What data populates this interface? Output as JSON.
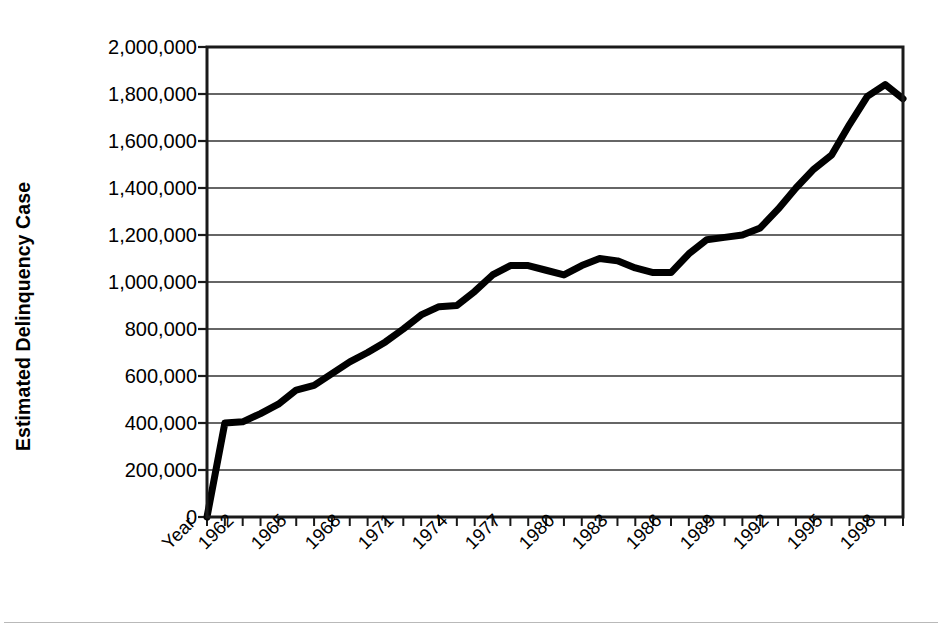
{
  "chart_data": {
    "type": "line",
    "title": "",
    "xlabel": "",
    "ylabel": "Estimated Delinquency Case",
    "x_axis_first_label": "Year",
    "xlim": [
      1960,
      1999
    ],
    "ylim": [
      0,
      2000000
    ],
    "ytick_labels": [
      "2,000,000",
      "1,800,000",
      "1,600,000",
      "1,400,000",
      "1,200,000",
      "1,000,000",
      "800,000",
      "600,000",
      "400,000",
      "200,000",
      "0"
    ],
    "ytick_values": [
      2000000,
      1800000,
      1600000,
      1400000,
      1200000,
      1000000,
      800000,
      600000,
      400000,
      200000,
      0
    ],
    "xtick_labels": [
      "Year",
      "1962",
      "1965",
      "1968",
      "1971",
      "1974",
      "1977",
      "1980",
      "1983",
      "1986",
      "1989",
      "1992",
      "1995",
      "1998"
    ],
    "xtick_values": [
      1960,
      1962,
      1965,
      1968,
      1971,
      1974,
      1977,
      1980,
      1983,
      1986,
      1989,
      1992,
      1995,
      1998
    ],
    "minor_tick_interval": 1,
    "grid": "horizontal",
    "legend": "none",
    "line_color": "#000000",
    "line_width": 7,
    "x": [
      1960,
      1961,
      1962,
      1963,
      1964,
      1965,
      1966,
      1967,
      1968,
      1969,
      1970,
      1971,
      1972,
      1973,
      1974,
      1975,
      1976,
      1977,
      1978,
      1979,
      1980,
      1981,
      1982,
      1983,
      1984,
      1985,
      1986,
      1987,
      1988,
      1989,
      1990,
      1991,
      1992,
      1993,
      1994,
      1995,
      1996,
      1997,
      1998,
      1999
    ],
    "values": [
      0,
      400000,
      405000,
      440000,
      480000,
      540000,
      560000,
      610000,
      660000,
      700000,
      745000,
      800000,
      860000,
      895000,
      900000,
      960000,
      1030000,
      1070000,
      1070000,
      1050000,
      1030000,
      1070000,
      1100000,
      1090000,
      1060000,
      1040000,
      1040000,
      1120000,
      1180000,
      1190000,
      1200000,
      1230000,
      1310000,
      1400000,
      1480000,
      1540000,
      1670000,
      1790000,
      1840000,
      1780000
    ],
    "series_name": "Estimated Delinquency Case"
  },
  "axes": {
    "y_axis_title": "Estimated Delinquency Case"
  }
}
